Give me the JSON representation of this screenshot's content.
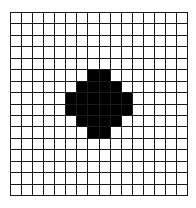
{
  "grid": {
    "rows": 16,
    "cols": 16,
    "line_color": "#1a1a1a",
    "empty_color": "#ffffff",
    "filled_color": "#000000",
    "filled_cells": [
      [
        5,
        7
      ],
      [
        5,
        8
      ],
      [
        6,
        6
      ],
      [
        6,
        7
      ],
      [
        6,
        8
      ],
      [
        6,
        9
      ],
      [
        7,
        5
      ],
      [
        7,
        6
      ],
      [
        7,
        7
      ],
      [
        7,
        8
      ],
      [
        7,
        9
      ],
      [
        7,
        10
      ],
      [
        8,
        5
      ],
      [
        8,
        6
      ],
      [
        8,
        7
      ],
      [
        8,
        8
      ],
      [
        8,
        9
      ],
      [
        8,
        10
      ],
      [
        9,
        6
      ],
      [
        9,
        7
      ],
      [
        9,
        8
      ],
      [
        9,
        9
      ],
      [
        10,
        7
      ],
      [
        10,
        8
      ]
    ]
  }
}
